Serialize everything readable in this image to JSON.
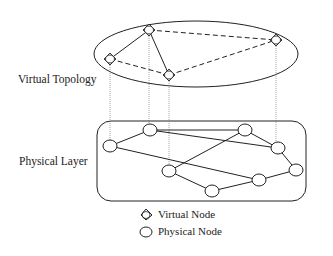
{
  "labels": {
    "virtual_topology": "Virtual Topology",
    "physical_layer": "Physical Layer"
  },
  "legend": {
    "virtual_node": "Virtual Node",
    "physical_node": "Physical Node"
  },
  "virtual_nodes": [
    {
      "id": "V1",
      "x": 110,
      "y": 59
    },
    {
      "id": "V2",
      "x": 149,
      "y": 30
    },
    {
      "id": "V3",
      "x": 169,
      "y": 75
    },
    {
      "id": "V4",
      "x": 276,
      "y": 40
    }
  ],
  "virtual_links": [
    {
      "from": "V1",
      "to": "V2",
      "style": "solid"
    },
    {
      "from": "V2",
      "to": "V3",
      "style": "solid"
    },
    {
      "from": "V2",
      "to": "V4",
      "style": "dashed"
    },
    {
      "from": "V1",
      "to": "V3",
      "style": "dashed"
    },
    {
      "from": "V3",
      "to": "V4",
      "style": "dashed"
    }
  ],
  "physical_nodes": [
    {
      "id": "P1",
      "x": 110,
      "y": 146
    },
    {
      "id": "P2",
      "x": 150,
      "y": 130
    },
    {
      "id": "P3",
      "x": 169,
      "y": 171
    },
    {
      "id": "P4",
      "x": 245,
      "y": 130
    },
    {
      "id": "P5",
      "x": 278,
      "y": 148
    },
    {
      "id": "P6",
      "x": 296,
      "y": 170
    },
    {
      "id": "P7",
      "x": 259,
      "y": 180
    },
    {
      "id": "P8",
      "x": 212,
      "y": 191
    }
  ],
  "physical_links": [
    {
      "from": "P1",
      "to": "P2"
    },
    {
      "from": "P2",
      "to": "P4"
    },
    {
      "from": "P2",
      "to": "P5"
    },
    {
      "from": "P4",
      "to": "P5"
    },
    {
      "from": "P5",
      "to": "P6"
    },
    {
      "from": "P6",
      "to": "P7"
    },
    {
      "from": "P7",
      "to": "P8"
    },
    {
      "from": "P8",
      "to": "P3"
    },
    {
      "from": "P3",
      "to": "P4"
    },
    {
      "from": "P1",
      "to": "P7"
    }
  ],
  "mappings": [
    {
      "virtual": "V1",
      "physical": "P1"
    },
    {
      "virtual": "V2",
      "physical": "P2"
    },
    {
      "virtual": "V3",
      "physical": "P3"
    },
    {
      "virtual": "V4",
      "physical": "P5"
    }
  ]
}
